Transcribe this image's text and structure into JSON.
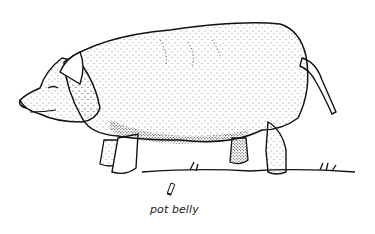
{
  "figure": {
    "style": "black-and-white stippled pen-and-ink drawing",
    "caption": "pot belly",
    "colors": {
      "background": "#ffffff",
      "ink": "#111111"
    }
  }
}
